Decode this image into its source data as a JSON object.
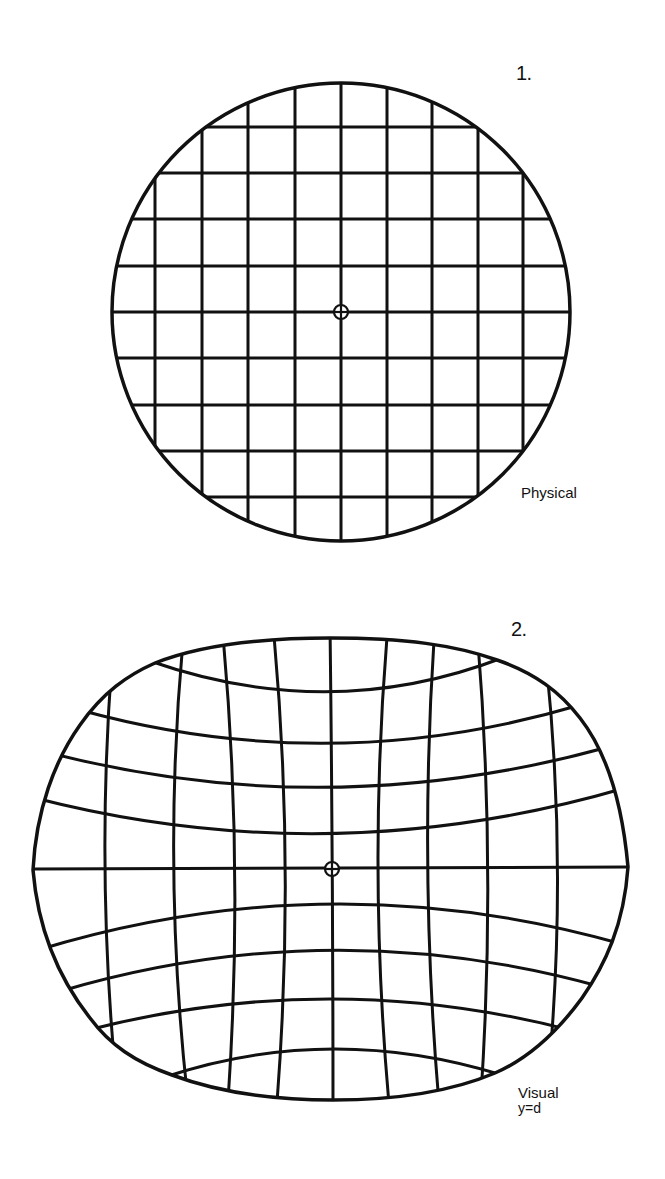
{
  "figures": [
    {
      "number": "1.",
      "caption": "Physical",
      "description": "Regular square grid inside a circle with a center fixation mark",
      "shape": "circle",
      "center": [
        341,
        312
      ],
      "radius": 230,
      "vertical_lines_x": [
        155,
        202,
        248,
        295,
        341,
        387,
        432,
        478,
        523
      ],
      "horizontal_lines_y": [
        127,
        173,
        219,
        266,
        312,
        358,
        405,
        451,
        497
      ]
    },
    {
      "number": "2.",
      "caption": "Visual",
      "caption_sub": "y=d",
      "description": "Distorted grid inside a rounded, wider-than-tall outline with a center fixation mark",
      "shape": "rounded-oval",
      "center": [
        332,
        869
      ]
    }
  ],
  "colors": {
    "background": "#ffffff",
    "ink": "#111111"
  }
}
